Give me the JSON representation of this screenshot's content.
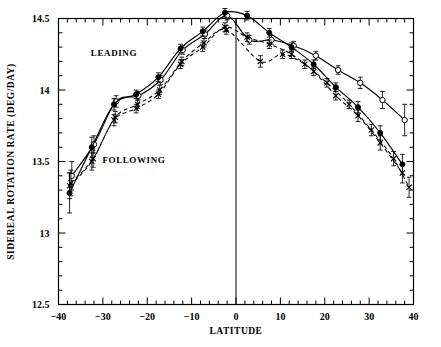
{
  "chart_data": {
    "type": "line",
    "title": "",
    "xlabel": "LATITUDE",
    "ylabel": "SIDEREAL ROTATION RATE (DEG/DAY)",
    "xlim": [
      -40,
      40
    ],
    "ylim": [
      12.5,
      14.5
    ],
    "x_ticks": [
      -40,
      -30,
      -20,
      -10,
      0,
      10,
      20,
      30,
      40
    ],
    "x_tick_labels": [
      "-40",
      "-30",
      "-20",
      "-10",
      "0",
      "10",
      "20",
      "30",
      "40"
    ],
    "x_minor_step": 2,
    "y_ticks": [
      12.5,
      13,
      13.5,
      14,
      14.5
    ],
    "y_tick_labels": [
      "12.5",
      "13",
      "13.5",
      "14",
      "14.5"
    ],
    "y_minor_step": 0.1,
    "grid": false,
    "legend_position": "inline-annotations",
    "annotations": [
      {
        "text": "LEADING",
        "x": -27.5,
        "y": 14.24
      },
      {
        "text": "FOLLOWING",
        "x": -23.0,
        "y": 13.49
      }
    ],
    "vertical_reference_line": {
      "x": 0,
      "style": "solid"
    },
    "series": [
      {
        "name": "LEADING-A",
        "label": "LEADING",
        "style": "solid",
        "marker": "open-circle",
        "points": [
          {
            "x": -37.0,
            "y": 13.4,
            "err": 0.1
          },
          {
            "x": -32.0,
            "y": 13.62,
            "err": 0.06
          },
          {
            "x": -27.0,
            "y": 13.92,
            "err": 0.04
          },
          {
            "x": -22.0,
            "y": 13.96,
            "err": 0.03
          },
          {
            "x": -17.0,
            "y": 14.07,
            "err": 0.03
          },
          {
            "x": -12.0,
            "y": 14.28,
            "err": 0.03
          },
          {
            "x": -7.0,
            "y": 14.39,
            "err": 0.03
          },
          {
            "x": -2.0,
            "y": 14.52,
            "err": 0.03
          },
          {
            "x": 3.0,
            "y": 14.35,
            "err": 0.03
          },
          {
            "x": 8.0,
            "y": 14.35,
            "err": 0.03
          },
          {
            "x": 13.0,
            "y": 14.31,
            "err": 0.03
          },
          {
            "x": 18.0,
            "y": 14.24,
            "err": 0.03
          },
          {
            "x": 23.0,
            "y": 14.14,
            "err": 0.03
          },
          {
            "x": 28.0,
            "y": 14.05,
            "err": 0.04
          },
          {
            "x": 33.0,
            "y": 13.93,
            "err": 0.06
          },
          {
            "x": 38.0,
            "y": 13.79,
            "err": 0.11
          }
        ]
      },
      {
        "name": "LEADING-B",
        "label": "LEADING",
        "style": "solid",
        "marker": "filled-circle",
        "points": [
          {
            "x": -37.5,
            "y": 13.28,
            "err": 0.14
          },
          {
            "x": -32.5,
            "y": 13.6,
            "err": 0.07
          },
          {
            "x": -27.5,
            "y": 13.9,
            "err": 0.04
          },
          {
            "x": -22.5,
            "y": 13.97,
            "err": 0.03
          },
          {
            "x": -17.5,
            "y": 14.09,
            "err": 0.03
          },
          {
            "x": -12.5,
            "y": 14.29,
            "err": 0.03
          },
          {
            "x": -7.5,
            "y": 14.41,
            "err": 0.03
          },
          {
            "x": -2.5,
            "y": 14.54,
            "err": 0.03
          },
          {
            "x": 2.5,
            "y": 14.52,
            "err": 0.03
          },
          {
            "x": 7.5,
            "y": 14.4,
            "err": 0.03
          },
          {
            "x": 12.5,
            "y": 14.3,
            "err": 0.03
          },
          {
            "x": 17.5,
            "y": 14.18,
            "err": 0.03
          },
          {
            "x": 22.5,
            "y": 14.02,
            "err": 0.03
          },
          {
            "x": 27.5,
            "y": 13.88,
            "err": 0.04
          },
          {
            "x": 32.5,
            "y": 13.7,
            "err": 0.05
          },
          {
            "x": 37.5,
            "y": 13.48,
            "err": 0.07
          }
        ]
      },
      {
        "name": "FOLLOWING-A",
        "label": "FOLLOWING",
        "style": "dashed",
        "marker": "cross",
        "points": [
          {
            "x": -37.5,
            "y": 13.33,
            "err": 0.09
          },
          {
            "x": -32.5,
            "y": 13.5,
            "err": 0.06
          },
          {
            "x": -27.5,
            "y": 13.79,
            "err": 0.04
          },
          {
            "x": -22.5,
            "y": 13.87,
            "err": 0.03
          },
          {
            "x": -17.5,
            "y": 13.97,
            "err": 0.03
          },
          {
            "x": -12.5,
            "y": 14.18,
            "err": 0.03
          },
          {
            "x": -7.5,
            "y": 14.3,
            "err": 0.03
          },
          {
            "x": -2.5,
            "y": 14.44,
            "err": 0.03
          },
          {
            "x": 2.5,
            "y": 14.37,
            "err": 0.03
          },
          {
            "x": 7.5,
            "y": 14.32,
            "err": 0.03
          },
          {
            "x": 12.5,
            "y": 14.25,
            "err": 0.03
          },
          {
            "x": 17.5,
            "y": 14.13,
            "err": 0.03
          },
          {
            "x": 22.5,
            "y": 13.96,
            "err": 0.03
          },
          {
            "x": 27.5,
            "y": 13.82,
            "err": 0.04
          },
          {
            "x": 32.5,
            "y": 13.63,
            "err": 0.05
          },
          {
            "x": 37.5,
            "y": 13.42,
            "err": 0.07
          }
        ]
      },
      {
        "name": "FOLLOWING-B",
        "label": "FOLLOWING",
        "style": "dashed",
        "marker": "cross",
        "points": [
          {
            "x": -37.2,
            "y": 13.35,
            "err": 0.09
          },
          {
            "x": -32.2,
            "y": 13.52,
            "err": 0.06
          },
          {
            "x": -27.2,
            "y": 13.81,
            "err": 0.04
          },
          {
            "x": -22.2,
            "y": 13.9,
            "err": 0.03
          },
          {
            "x": -17.2,
            "y": 14.0,
            "err": 0.03
          },
          {
            "x": -12.2,
            "y": 14.2,
            "err": 0.03
          },
          {
            "x": -7.2,
            "y": 14.33,
            "err": 0.03
          },
          {
            "x": -2.2,
            "y": 14.42,
            "err": 0.03
          },
          {
            "x": 5.5,
            "y": 14.2,
            "err": 0.04
          },
          {
            "x": 10.5,
            "y": 14.25,
            "err": 0.03
          },
          {
            "x": 15.5,
            "y": 14.18,
            "err": 0.03
          },
          {
            "x": 20.5,
            "y": 14.05,
            "err": 0.03
          },
          {
            "x": 25.5,
            "y": 13.9,
            "err": 0.03
          },
          {
            "x": 30.5,
            "y": 13.72,
            "err": 0.04
          },
          {
            "x": 35.5,
            "y": 13.52,
            "err": 0.05
          },
          {
            "x": 39.0,
            "y": 13.32,
            "err": 0.07
          }
        ]
      }
    ]
  }
}
